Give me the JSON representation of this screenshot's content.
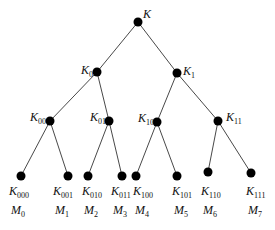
{
  "diagram": {
    "type": "binary-key-tree",
    "nodes": [
      {
        "id": "K",
        "label": "K",
        "sub": ""
      },
      {
        "id": "K0",
        "label": "K",
        "sub": "0",
        "parent": "K"
      },
      {
        "id": "K1",
        "label": "K",
        "sub": "1",
        "parent": "K"
      },
      {
        "id": "K00",
        "label": "K",
        "sub": "00",
        "parent": "K0"
      },
      {
        "id": "K01",
        "label": "K",
        "sub": "01",
        "parent": "K0"
      },
      {
        "id": "K10",
        "label": "K",
        "sub": "10",
        "parent": "K1"
      },
      {
        "id": "K11",
        "label": "K",
        "sub": "11",
        "parent": "K1"
      },
      {
        "id": "K000",
        "label": "K",
        "sub": "000",
        "parent": "K00",
        "member": {
          "label": "M",
          "sub": "0"
        }
      },
      {
        "id": "K001",
        "label": "K",
        "sub": "001",
        "parent": "K00",
        "member": {
          "label": "M",
          "sub": "1"
        }
      },
      {
        "id": "K010",
        "label": "K",
        "sub": "010",
        "parent": "K01",
        "member": {
          "label": "M",
          "sub": "2"
        }
      },
      {
        "id": "K011",
        "label": "K",
        "sub": "011",
        "parent": "K01",
        "member": {
          "label": "M",
          "sub": "3"
        }
      },
      {
        "id": "K100",
        "label": "K",
        "sub": "100",
        "parent": "K10",
        "member": {
          "label": "M",
          "sub": "4"
        }
      },
      {
        "id": "K101",
        "label": "K",
        "sub": "101",
        "parent": "K10",
        "member": {
          "label": "M",
          "sub": "5"
        }
      },
      {
        "id": "K110",
        "label": "K",
        "sub": "110",
        "parent": "K11",
        "member": {
          "label": "M",
          "sub": "6"
        }
      },
      {
        "id": "K111",
        "label": "K",
        "sub": "111",
        "parent": "K11",
        "member": {
          "label": "M",
          "sub": "7"
        }
      }
    ]
  }
}
